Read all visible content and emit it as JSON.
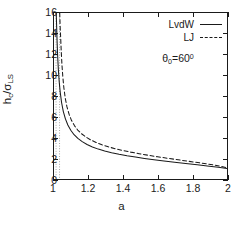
{
  "figure": {
    "background": "#ffffff",
    "axis_color": "#1a1a1a"
  },
  "axes": {
    "x_title": "a",
    "y_title_html": "h<sub>c</sub>/σ<sub>LS</sub>",
    "x_ticklabels": [
      "1",
      "1.2",
      "1.4",
      "1.6",
      "1.8",
      "2"
    ],
    "y_ticklabels": [
      "0",
      "2",
      "4",
      "6",
      "8",
      "10",
      "12",
      "14",
      "16"
    ]
  },
  "legend": {
    "entries": [
      {
        "label": "LvdW",
        "style": "solid"
      },
      {
        "label": "LJ",
        "style": "dashed"
      }
    ]
  },
  "annotation": {
    "text_html": "θ<sub>0</sub>=60<sup>0</sup>"
  },
  "chart_data": {
    "type": "line",
    "title": "",
    "xlabel": "a",
    "ylabel": "h_c/sigma_LS",
    "xlim": [
      1,
      2
    ],
    "ylim": [
      0,
      16
    ],
    "xticks": [
      1,
      1.2,
      1.4,
      1.6,
      1.8,
      2
    ],
    "yticks": [
      0,
      2,
      4,
      6,
      8,
      10,
      12,
      14,
      16
    ],
    "grid": false,
    "legend_position": "upper right",
    "annotations": [
      {
        "text": "theta_0 = 60 deg",
        "x": 1.56,
        "y": 12.4
      }
    ],
    "asymptotes": [
      {
        "name": "LvdW-asymptote",
        "x": 1.012,
        "style": "dotted",
        "color": "#9a9a9a"
      },
      {
        "name": "LJ-asymptote",
        "x": 1.032,
        "style": "dotted",
        "color": "#9a9a9a"
      }
    ],
    "series": [
      {
        "name": "LvdW",
        "style": "solid",
        "color": "#1a1a1a",
        "x": [
          1.013,
          1.014,
          1.016,
          1.018,
          1.021,
          1.025,
          1.03,
          1.036,
          1.044,
          1.054,
          1.066,
          1.08,
          1.097,
          1.116,
          1.138,
          1.163,
          1.191,
          1.222,
          1.256,
          1.293,
          1.333,
          1.376,
          1.422,
          1.471,
          1.523,
          1.578,
          1.636,
          1.697,
          1.761,
          1.828,
          1.898,
          1.95,
          2.0
        ],
        "y": [
          16.0,
          15.4,
          14.3,
          13.2,
          11.9,
          10.6,
          9.4,
          8.35,
          7.35,
          6.5,
          5.8,
          5.2,
          4.7,
          4.27,
          3.91,
          3.6,
          3.33,
          3.09,
          2.88,
          2.7,
          2.53,
          2.38,
          2.24,
          2.11,
          1.98,
          1.86,
          1.74,
          1.62,
          1.5,
          1.37,
          1.23,
          1.13,
          1.02
        ]
      },
      {
        "name": "LJ",
        "style": "dashed",
        "color": "#1a1a1a",
        "x": [
          1.033,
          1.034,
          1.036,
          1.039,
          1.042,
          1.046,
          1.051,
          1.057,
          1.065,
          1.075,
          1.087,
          1.101,
          1.118,
          1.137,
          1.159,
          1.184,
          1.212,
          1.243,
          1.277,
          1.314,
          1.354,
          1.397,
          1.443,
          1.492,
          1.544,
          1.599,
          1.657,
          1.718,
          1.782,
          1.849,
          1.919,
          1.96,
          2.0
        ],
        "y": [
          16.0,
          15.5,
          14.5,
          13.45,
          12.25,
          11.0,
          9.85,
          8.8,
          7.8,
          6.95,
          6.25,
          5.65,
          5.15,
          4.72,
          4.36,
          4.05,
          3.77,
          3.52,
          3.3,
          3.1,
          2.92,
          2.75,
          2.59,
          2.44,
          2.29,
          2.14,
          2.0,
          1.85,
          1.7,
          1.54,
          1.36,
          1.24,
          1.08
        ]
      }
    ]
  }
}
